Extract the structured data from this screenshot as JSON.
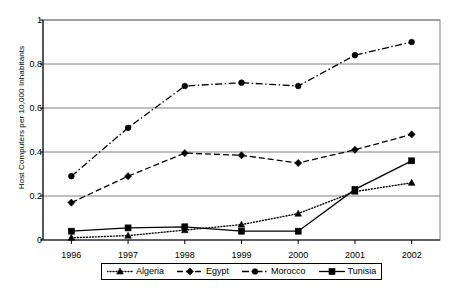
{
  "chart_data": {
    "type": "line",
    "title": "",
    "xlabel": "",
    "ylabel": "Host Computers per 10,000 Inhabitants",
    "categories": [
      "1996",
      "1997",
      "1998",
      "1999",
      "2000",
      "2001",
      "2002"
    ],
    "x": [
      1996,
      1997,
      1998,
      1999,
      2000,
      2001,
      2002
    ],
    "ylim": [
      0,
      1
    ],
    "yticks": [
      "0",
      "0.2",
      "0.4",
      "0.6",
      "0.8",
      "1"
    ],
    "ytick_values": [
      0,
      0.2,
      0.4,
      0.6,
      0.8,
      1
    ],
    "grid": "horizontal",
    "legend_position": "bottom",
    "series": [
      {
        "name": "Algeria",
        "values": [
          0.01,
          0.02,
          0.045,
          0.07,
          0.12,
          0.22,
          0.26
        ],
        "marker": "triangle",
        "dash": "dotted",
        "color": "#000000"
      },
      {
        "name": "Egypt",
        "values": [
          0.17,
          0.29,
          0.395,
          0.385,
          0.35,
          0.41,
          0.48
        ],
        "marker": "diamond",
        "dash": "dashed",
        "color": "#000000"
      },
      {
        "name": "Morocco",
        "values": [
          0.29,
          0.51,
          0.7,
          0.715,
          0.7,
          0.84,
          0.9
        ],
        "marker": "circle",
        "dash": "dash-dot",
        "color": "#000000"
      },
      {
        "name": "Tunisia",
        "values": [
          0.04,
          0.055,
          0.06,
          0.04,
          0.04,
          0.23,
          0.36
        ],
        "marker": "square",
        "dash": "solid",
        "color": "#000000"
      }
    ]
  },
  "legend": {
    "items": [
      {
        "label": "Algeria"
      },
      {
        "label": "Egypt"
      },
      {
        "label": "Morocco"
      },
      {
        "label": "Tunisia"
      }
    ]
  }
}
